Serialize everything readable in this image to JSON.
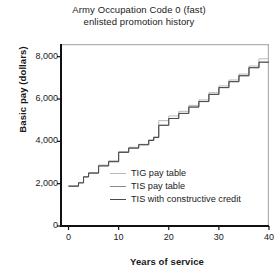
{
  "chart_data": {
    "type": "line",
    "title": "Army Occupation Code 0 (fast) enlisted promotion history",
    "title_lines": [
      "Army Occupation Code 0 (fast)",
      "enlisted promotion history"
    ],
    "xlabel": "Years of service",
    "ylabel": "Basic pay (dollars)",
    "xlim": [
      -1.5,
      40
    ],
    "ylim": [
      0,
      8600
    ],
    "grid": false,
    "legend_position": "inside-bottom-left",
    "step_style": "post",
    "xticks": [
      0,
      10,
      20,
      30,
      40
    ],
    "xtick_labels": [
      "0",
      "10",
      "20",
      "30",
      "40"
    ],
    "yticks": [
      0,
      2000,
      4000,
      6000,
      8000
    ],
    "ytick_labels": [
      "0",
      "2,000",
      "4,000",
      "6,000",
      "8,000"
    ],
    "colors": {
      "tig": "#b9b9b9",
      "tis": "#8a8a8a",
      "tis_cc": "#4a4a4a",
      "axis": "#111111",
      "frame": "#b0b0b0",
      "text": "#1a1a1a"
    },
    "series": [
      {
        "name": "TIG pay table",
        "color": "#b9b9b9",
        "x": [
          0,
          2,
          3,
          4,
          6,
          8,
          10,
          12,
          14,
          16,
          17,
          18,
          20,
          22,
          24,
          26,
          28,
          30,
          32,
          34,
          36,
          38,
          40
        ],
        "values": [
          1900,
          2060,
          2340,
          2520,
          2880,
          3080,
          3520,
          3720,
          3860,
          4080,
          4220,
          4980,
          5200,
          5420,
          5700,
          5960,
          6300,
          6620,
          6900,
          7180,
          7560,
          7900,
          7900
        ]
      },
      {
        "name": "TIS pay table",
        "color": "#8a8a8a",
        "x": [
          0,
          2,
          3,
          4,
          6,
          8,
          10,
          12,
          14,
          16,
          17,
          18,
          20,
          22,
          24,
          26,
          28,
          30,
          32,
          34,
          36,
          38,
          40
        ],
        "values": [
          1880,
          2040,
          2320,
          2500,
          2840,
          3040,
          3480,
          3680,
          3840,
          4040,
          4180,
          4760,
          5080,
          5320,
          5620,
          5880,
          6220,
          6540,
          6820,
          7100,
          7480,
          7740,
          7740
        ]
      },
      {
        "name": "TIS with constructive credit",
        "color": "#4a4a4a",
        "x": [
          0,
          2,
          3,
          4,
          6,
          8,
          10,
          12,
          14,
          16,
          17,
          18,
          20,
          22,
          24,
          26,
          28,
          30,
          32,
          34,
          36,
          38,
          40
        ],
        "values": [
          1880,
          2040,
          2320,
          2500,
          2840,
          3040,
          3480,
          3680,
          3840,
          4040,
          4180,
          4760,
          5080,
          5320,
          5620,
          5880,
          6220,
          6540,
          6820,
          7100,
          7480,
          7740,
          7740
        ]
      }
    ]
  }
}
